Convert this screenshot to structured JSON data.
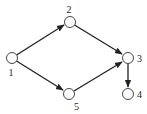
{
  "diagram": {
    "type": "directed-graph",
    "nodes": [
      {
        "id": "1",
        "label": "1",
        "x": 12,
        "y": 58
      },
      {
        "id": "2",
        "label": "2",
        "x": 70,
        "y": 22
      },
      {
        "id": "3",
        "label": "3",
        "x": 128,
        "y": 58
      },
      {
        "id": "4",
        "label": "4",
        "x": 128,
        "y": 94
      },
      {
        "id": "5",
        "label": "5",
        "x": 69,
        "y": 94
      }
    ],
    "edges": [
      {
        "from": "1",
        "to": "2"
      },
      {
        "from": "2",
        "to": "3"
      },
      {
        "from": "1",
        "to": "5"
      },
      {
        "from": "5",
        "to": "3"
      },
      {
        "from": "3",
        "to": "4"
      }
    ]
  }
}
